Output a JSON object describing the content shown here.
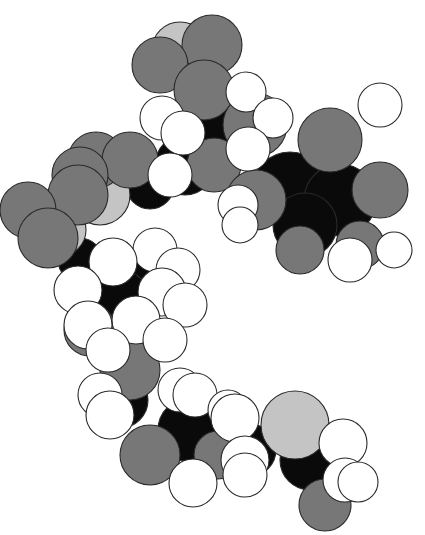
{
  "figure": {
    "type": "space-filling molecular model",
    "background": "#ffffff",
    "palette": {
      "H": "#ffffff",
      "C": "#0a0a0a",
      "O": "#777777",
      "S": "#c4c4c4"
    },
    "legend_semantics": {
      "H": "hydrogen (white)",
      "C": "carbon (black)",
      "O": "oxygen/nitrogen (medium gray)",
      "S": "sulfur/phosphorus (light gray)"
    }
  },
  "atoms": [
    {
      "el": "C",
      "x": 225,
      "y": 130,
      "r": 34
    },
    {
      "el": "C",
      "x": 185,
      "y": 165,
      "r": 30
    },
    {
      "el": "C",
      "x": 290,
      "y": 190,
      "r": 38
    },
    {
      "el": "C",
      "x": 340,
      "y": 200,
      "r": 36
    },
    {
      "el": "C",
      "x": 305,
      "y": 225,
      "r": 32
    },
    {
      "el": "C",
      "x": 150,
      "y": 185,
      "r": 24
    },
    {
      "el": "C",
      "x": 120,
      "y": 300,
      "r": 30
    },
    {
      "el": "C",
      "x": 150,
      "y": 270,
      "r": 28
    },
    {
      "el": "C",
      "x": 120,
      "y": 400,
      "r": 28
    },
    {
      "el": "C",
      "x": 190,
      "y": 430,
      "r": 32
    },
    {
      "el": "C",
      "x": 250,
      "y": 450,
      "r": 26
    },
    {
      "el": "C",
      "x": 310,
      "y": 460,
      "r": 30
    },
    {
      "el": "C",
      "x": 80,
      "y": 260,
      "r": 22
    },
    {
      "el": "S",
      "x": 180,
      "y": 50,
      "r": 28
    },
    {
      "el": "S",
      "x": 100,
      "y": 195,
      "r": 30
    },
    {
      "el": "S",
      "x": 60,
      "y": 230,
      "r": 26
    },
    {
      "el": "S",
      "x": 295,
      "y": 425,
      "r": 34
    },
    {
      "el": "O",
      "x": 160,
      "y": 65,
      "r": 28
    },
    {
      "el": "O",
      "x": 212,
      "y": 45,
      "r": 30
    },
    {
      "el": "O",
      "x": 204,
      "y": 90,
      "r": 30
    },
    {
      "el": "O",
      "x": 255,
      "y": 125,
      "r": 32
    },
    {
      "el": "O",
      "x": 214,
      "y": 165,
      "r": 27
    },
    {
      "el": "O",
      "x": 96,
      "y": 160,
      "r": 28
    },
    {
      "el": "O",
      "x": 130,
      "y": 160,
      "r": 28
    },
    {
      "el": "O",
      "x": 80,
      "y": 175,
      "r": 28
    },
    {
      "el": "O",
      "x": 78,
      "y": 195,
      "r": 30
    },
    {
      "el": "O",
      "x": 28,
      "y": 210,
      "r": 28
    },
    {
      "el": "O",
      "x": 48,
      "y": 238,
      "r": 30
    },
    {
      "el": "O",
      "x": 330,
      "y": 140,
      "r": 32
    },
    {
      "el": "O",
      "x": 380,
      "y": 190,
      "r": 28
    },
    {
      "el": "O",
      "x": 256,
      "y": 200,
      "r": 30
    },
    {
      "el": "O",
      "x": 300,
      "y": 250,
      "r": 24
    },
    {
      "el": "O",
      "x": 360,
      "y": 245,
      "r": 24
    },
    {
      "el": "O",
      "x": 90,
      "y": 330,
      "r": 26
    },
    {
      "el": "O",
      "x": 130,
      "y": 370,
      "r": 30
    },
    {
      "el": "O",
      "x": 150,
      "y": 455,
      "r": 30
    },
    {
      "el": "O",
      "x": 218,
      "y": 455,
      "r": 24
    },
    {
      "el": "O",
      "x": 325,
      "y": 505,
      "r": 26
    },
    {
      "el": "H",
      "x": 246,
      "y": 92,
      "r": 20
    },
    {
      "el": "H",
      "x": 273,
      "y": 118,
      "r": 20
    },
    {
      "el": "H",
      "x": 248,
      "y": 149,
      "r": 22
    },
    {
      "el": "H",
      "x": 183,
      "y": 133,
      "r": 22
    },
    {
      "el": "H",
      "x": 170,
      "y": 175,
      "r": 22
    },
    {
      "el": "H",
      "x": 162,
      "y": 118,
      "r": 22
    },
    {
      "el": "H",
      "x": 238,
      "y": 205,
      "r": 20
    },
    {
      "el": "H",
      "x": 240,
      "y": 225,
      "r": 18
    },
    {
      "el": "H",
      "x": 380,
      "y": 105,
      "r": 22
    },
    {
      "el": "H",
      "x": 394,
      "y": 250,
      "r": 18
    },
    {
      "el": "H",
      "x": 350,
      "y": 260,
      "r": 22
    },
    {
      "el": "H",
      "x": 113,
      "y": 262,
      "r": 24
    },
    {
      "el": "H",
      "x": 78,
      "y": 290,
      "r": 24
    },
    {
      "el": "H",
      "x": 155,
      "y": 250,
      "r": 22
    },
    {
      "el": "H",
      "x": 178,
      "y": 270,
      "r": 22
    },
    {
      "el": "H",
      "x": 162,
      "y": 292,
      "r": 24
    },
    {
      "el": "H",
      "x": 185,
      "y": 305,
      "r": 22
    },
    {
      "el": "H",
      "x": 136,
      "y": 320,
      "r": 24
    },
    {
      "el": "H",
      "x": 88,
      "y": 325,
      "r": 24
    },
    {
      "el": "H",
      "x": 108,
      "y": 350,
      "r": 22
    },
    {
      "el": "H",
      "x": 165,
      "y": 340,
      "r": 22
    },
    {
      "el": "H",
      "x": 100,
      "y": 395,
      "r": 22
    },
    {
      "el": "H",
      "x": 110,
      "y": 415,
      "r": 24
    },
    {
      "el": "H",
      "x": 180,
      "y": 390,
      "r": 22
    },
    {
      "el": "H",
      "x": 195,
      "y": 395,
      "r": 22
    },
    {
      "el": "H",
      "x": 235,
      "y": 418,
      "r": 24
    },
    {
      "el": "H",
      "x": 228,
      "y": 410,
      "r": 20
    },
    {
      "el": "H",
      "x": 193,
      "y": 483,
      "r": 24
    },
    {
      "el": "H",
      "x": 245,
      "y": 460,
      "r": 24
    },
    {
      "el": "H",
      "x": 245,
      "y": 475,
      "r": 22
    },
    {
      "el": "H",
      "x": 343,
      "y": 443,
      "r": 24
    },
    {
      "el": "H",
      "x": 345,
      "y": 480,
      "r": 22
    },
    {
      "el": "H",
      "x": 358,
      "y": 482,
      "r": 20
    }
  ]
}
